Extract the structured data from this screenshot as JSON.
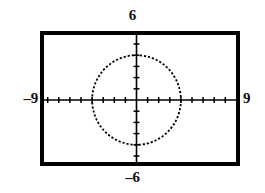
{
  "figure": {
    "name": "graphing-calculator-viewport",
    "background_color": "#ffffff",
    "ink_color": "#000000"
  },
  "window_labels": {
    "ymax": "6",
    "ymin": "–6",
    "xmin": "–9",
    "xmax": "9"
  },
  "chart_data": {
    "type": "scatter",
    "title": "",
    "subtitle": "",
    "xlabel": "",
    "ylabel": "",
    "grid": false,
    "legend": null,
    "legend_position": "none",
    "xlim": [
      -9,
      9
    ],
    "ylim": [
      -6,
      6
    ],
    "x_tick_step": 1,
    "y_tick_step": 1,
    "x_ticks": [
      -9,
      -8,
      -7,
      -6,
      -5,
      -4,
      -3,
      -2,
      -1,
      0,
      1,
      2,
      3,
      4,
      5,
      6,
      7,
      8,
      9
    ],
    "y_ticks": [
      -6,
      -5,
      -4,
      -3,
      -2,
      -1,
      0,
      1,
      2,
      3,
      4,
      5,
      6
    ],
    "x_tick_labels": [
      "",
      "",
      "",
      "",
      "",
      "",
      "",
      "",
      "",
      "",
      "",
      "",
      "",
      "",
      "",
      "",
      "",
      "",
      ""
    ],
    "y_tick_labels": [
      "",
      "",
      "",
      "",
      "",
      "",
      "",
      "",
      "",
      "",
      "",
      "",
      ""
    ],
    "annotations": [
      {
        "name": "ymax-label",
        "text": "6",
        "position": "top-center-outside"
      },
      {
        "name": "ymin-label",
        "text": "–6",
        "position": "bottom-center-outside"
      },
      {
        "name": "xmin-label",
        "text": "–9",
        "position": "left-middle-outside"
      },
      {
        "name": "xmax-label",
        "text": "9",
        "position": "right-middle-outside"
      }
    ],
    "series": [
      {
        "name": "circle",
        "kind": "curve",
        "style": "dotted",
        "color": "#000000",
        "equation": "x^2 + y^2 = 16",
        "center": [
          0,
          0
        ],
        "radius": 4
      }
    ]
  },
  "geometry": {
    "frame_left_px": 40,
    "frame_top_px": 31,
    "frame_right_px": 240,
    "frame_bottom_px": 166,
    "frame_stroke_px": 4,
    "origin_x_px": 136.5,
    "origin_y_px": 100,
    "px_per_unit_x": 11.1,
    "px_per_unit_y": 11.2,
    "tick_half_len_px": 3,
    "circle_radius_px": 45
  }
}
